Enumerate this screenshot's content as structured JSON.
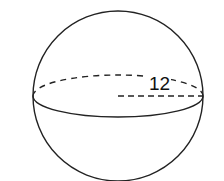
{
  "diagram": {
    "type": "sphere",
    "radius_label": "12",
    "colors": {
      "stroke": "#222222",
      "background": "#ffffff",
      "text": "#111111"
    }
  }
}
